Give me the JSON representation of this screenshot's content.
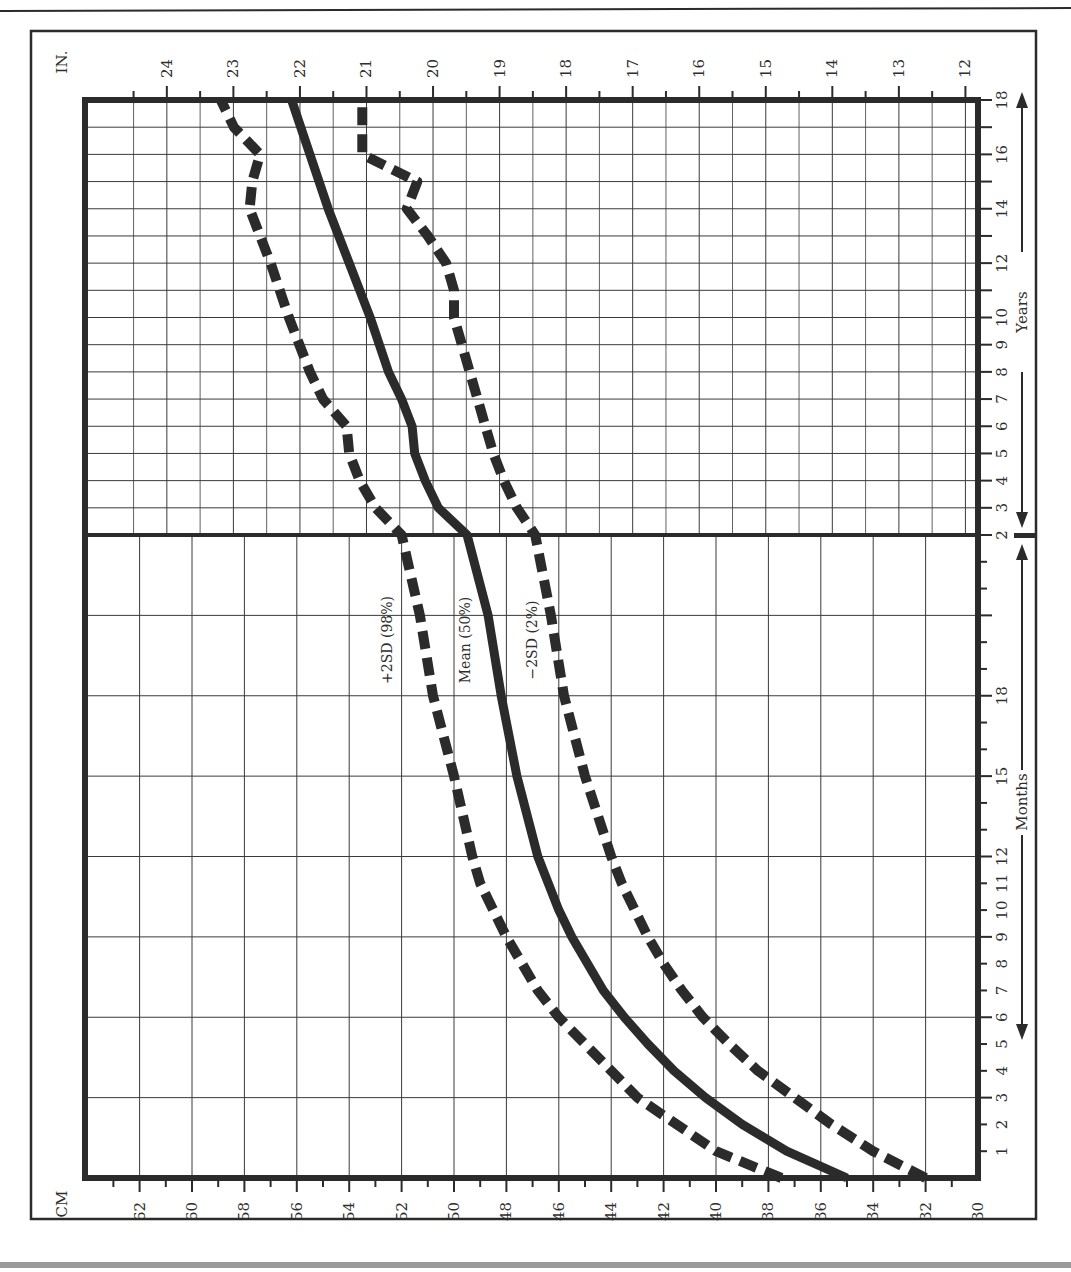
{
  "chart_data": {
    "type": "line",
    "orientation": "rotated 90 degrees (age axis vertical on right side, reading bottom-to-top; length axis horizontal, decreasing left-to-right)",
    "title": "",
    "x_axis_left_label": "CM",
    "x_axis_top_label": "IN.",
    "age_axis_label_months": "Months",
    "age_axis_label_years": "Years",
    "cm_ticks": [
      62,
      60,
      58,
      56,
      54,
      52,
      50,
      48,
      46,
      44,
      42,
      40,
      38,
      36,
      34,
      32,
      30
    ],
    "in_ticks": [
      24,
      23,
      22,
      21,
      20,
      19,
      18,
      17,
      16,
      15,
      14,
      13,
      12
    ],
    "month_tick_labels": [
      "1",
      "2",
      "3",
      "4",
      "5",
      "6",
      "7",
      "8",
      "9",
      "10",
      "11",
      "12",
      "15",
      "18"
    ],
    "year_tick_labels": [
      "2",
      "3",
      "4",
      "5",
      "6",
      "7",
      "8",
      "9",
      "10",
      "12",
      "14",
      "16",
      "18"
    ],
    "cm_range": [
      30,
      64
    ],
    "grid": true,
    "series": [
      {
        "name": "+2SD (98%)",
        "style": "dashed",
        "points": [
          {
            "age": "0m",
            "cm": 37.5
          },
          {
            "age": "1m",
            "cm": 40
          },
          {
            "age": "2m",
            "cm": 41.5
          },
          {
            "age": "3m",
            "cm": 43
          },
          {
            "age": "4m",
            "cm": 44
          },
          {
            "age": "5m",
            "cm": 45
          },
          {
            "age": "6m",
            "cm": 46
          },
          {
            "age": "7m",
            "cm": 46.8
          },
          {
            "age": "8m",
            "cm": 47.4
          },
          {
            "age": "9m",
            "cm": 48
          },
          {
            "age": "10m",
            "cm": 48.5
          },
          {
            "age": "11m",
            "cm": 49
          },
          {
            "age": "12m",
            "cm": 49.3
          },
          {
            "age": "15m",
            "cm": 50
          },
          {
            "age": "18m",
            "cm": 50.8
          },
          {
            "age": "21m",
            "cm": 51.3
          },
          {
            "age": "2y",
            "cm": 52
          },
          {
            "age": "3y",
            "cm": 53
          },
          {
            "age": "4y",
            "cm": 53.6
          },
          {
            "age": "5y",
            "cm": 54
          },
          {
            "age": "6y",
            "cm": 54.1
          },
          {
            "age": "7y",
            "cm": 55
          },
          {
            "age": "8y",
            "cm": 55.5
          },
          {
            "age": "10y",
            "cm": 56.3
          },
          {
            "age": "12y",
            "cm": 57
          },
          {
            "age": "14y",
            "cm": 57.8
          },
          {
            "age": "15y",
            "cm": 57.7
          },
          {
            "age": "16y",
            "cm": 57.4
          },
          {
            "age": "17y",
            "cm": 58.4
          },
          {
            "age": "18y",
            "cm": 58.9
          }
        ]
      },
      {
        "name": "Mean (50%)",
        "style": "solid",
        "points": [
          {
            "age": "0m",
            "cm": 35
          },
          {
            "age": "1m",
            "cm": 37.3
          },
          {
            "age": "2m",
            "cm": 39
          },
          {
            "age": "3m",
            "cm": 40.4
          },
          {
            "age": "4m",
            "cm": 41.6
          },
          {
            "age": "5m",
            "cm": 42.6
          },
          {
            "age": "6m",
            "cm": 43.5
          },
          {
            "age": "7m",
            "cm": 44.3
          },
          {
            "age": "8m",
            "cm": 44.9
          },
          {
            "age": "9m",
            "cm": 45.5
          },
          {
            "age": "10m",
            "cm": 46
          },
          {
            "age": "11m",
            "cm": 46.4
          },
          {
            "age": "12m",
            "cm": 46.8
          },
          {
            "age": "15m",
            "cm": 47.6
          },
          {
            "age": "18m",
            "cm": 48.2
          },
          {
            "age": "21m",
            "cm": 48.7
          },
          {
            "age": "2y",
            "cm": 49.5
          },
          {
            "age": "3y",
            "cm": 50.6
          },
          {
            "age": "4y",
            "cm": 51.1
          },
          {
            "age": "5y",
            "cm": 51.5
          },
          {
            "age": "6y",
            "cm": 51.6
          },
          {
            "age": "7y",
            "cm": 52
          },
          {
            "age": "8y",
            "cm": 52.5
          },
          {
            "age": "10y",
            "cm": 53.2
          },
          {
            "age": "12y",
            "cm": 54
          },
          {
            "age": "14y",
            "cm": 54.8
          },
          {
            "age": "16y",
            "cm": 55.5
          },
          {
            "age": "18y",
            "cm": 56.2
          }
        ]
      },
      {
        "name": "-2SD (2%)",
        "style": "dashed",
        "points": [
          {
            "age": "0m",
            "cm": 32
          },
          {
            "age": "1m",
            "cm": 34
          },
          {
            "age": "2m",
            "cm": 35.6
          },
          {
            "age": "3m",
            "cm": 37
          },
          {
            "age": "4m",
            "cm": 38.4
          },
          {
            "age": "5m",
            "cm": 39.5
          },
          {
            "age": "6m",
            "cm": 40.5
          },
          {
            "age": "7m",
            "cm": 41.3
          },
          {
            "age": "8m",
            "cm": 42
          },
          {
            "age": "9m",
            "cm": 42.6
          },
          {
            "age": "10m",
            "cm": 43.1
          },
          {
            "age": "11m",
            "cm": 43.6
          },
          {
            "age": "12m",
            "cm": 44
          },
          {
            "age": "15m",
            "cm": 45
          },
          {
            "age": "18m",
            "cm": 45.8
          },
          {
            "age": "21m",
            "cm": 46.3
          },
          {
            "age": "2y",
            "cm": 46.9
          },
          {
            "age": "3y",
            "cm": 47.6
          },
          {
            "age": "4y",
            "cm": 48.1
          },
          {
            "age": "5y",
            "cm": 48.5
          },
          {
            "age": "6y",
            "cm": 48.8
          },
          {
            "age": "7y",
            "cm": 49.1
          },
          {
            "age": "8y",
            "cm": 49.4
          },
          {
            "age": "9y",
            "cm": 49.7
          },
          {
            "age": "10y",
            "cm": 50
          },
          {
            "age": "11y",
            "cm": 50
          },
          {
            "age": "12y",
            "cm": 50.3
          },
          {
            "age": "13y",
            "cm": 51
          },
          {
            "age": "14y",
            "cm": 51.8
          },
          {
            "age": "15y",
            "cm": 51.4
          },
          {
            "age": "16y",
            "cm": 53.5
          },
          {
            "age": "17y",
            "cm": 53.5
          },
          {
            "age": "18y",
            "cm": 53.5
          }
        ]
      }
    ]
  },
  "labels": {
    "cm": "CM",
    "in": "IN.",
    "months": "Months",
    "years": "Years",
    "plus2sd": "+2SD (98%)",
    "mean": "Mean (50%)",
    "minus2sd": "−2SD (2%)"
  },
  "colors": {
    "ink": "#2b2b2b",
    "grid": "#3a3a3a",
    "background": "#ffffff",
    "footer_bar": "#9a9a9a"
  }
}
